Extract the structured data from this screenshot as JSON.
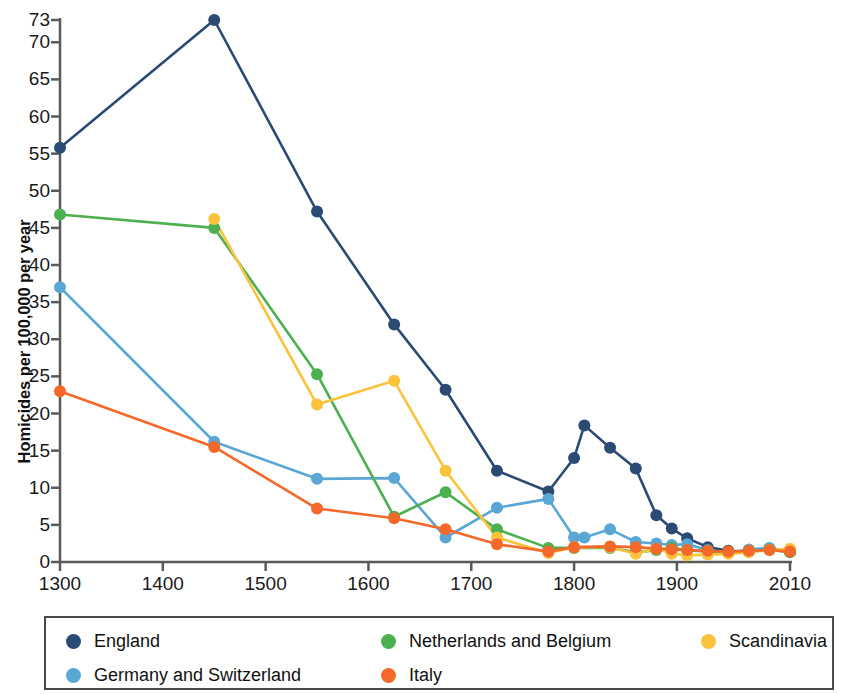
{
  "chart_data": {
    "type": "line",
    "title": "",
    "xlabel": "",
    "ylabel": "Homicides per 100,000 per year",
    "xlim": [
      1300,
      2010
    ],
    "ylim": [
      0,
      73
    ],
    "grid": false,
    "legend_position": "bottom",
    "x_ticks": [
      1300,
      1400,
      1500,
      1600,
      1700,
      1800,
      1900,
      2010
    ],
    "x_tick_labels": [
      "1300",
      "1400",
      "1500",
      "1600",
      "1700",
      "1800",
      "1900",
      "2010"
    ],
    "y_ticks": [
      0,
      5,
      10,
      15,
      20,
      25,
      30,
      35,
      40,
      45,
      50,
      55,
      60,
      65,
      70,
      73
    ],
    "y_tick_labels": [
      "0",
      "5",
      "10",
      "15",
      "20",
      "25",
      "30",
      "35",
      "40",
      "45",
      "50",
      "55",
      "60",
      "65",
      "70",
      "73"
    ],
    "series": [
      {
        "name": "England",
        "color": "#2b4a74",
        "x": [
          1300,
          1450,
          1550,
          1625,
          1675,
          1725,
          1775,
          1800,
          1810,
          1835,
          1860,
          1880,
          1895,
          1910,
          1930,
          1950,
          1970,
          1990,
          2010
        ],
        "values": [
          55.8,
          73.0,
          47.2,
          32.0,
          23.2,
          12.3,
          9.5,
          14.0,
          18.4,
          15.4,
          12.6,
          6.3,
          4.5,
          3.2,
          2.0,
          1.5,
          1.4,
          1.8,
          1.4
        ]
      },
      {
        "name": "Germany and Switzerland",
        "color": "#5aa7d6",
        "x": [
          1300,
          1450,
          1550,
          1625,
          1675,
          1725,
          1775,
          1800,
          1810,
          1835,
          1860,
          1880,
          1895,
          1910,
          1930,
          1950,
          1970,
          1990,
          2010
        ],
        "values": [
          37.0,
          16.2,
          11.2,
          11.3,
          3.3,
          7.3,
          8.5,
          3.3,
          3.3,
          4.4,
          2.7,
          2.5,
          2.3,
          2.4,
          1.6,
          1.2,
          1.7,
          1.9,
          1.4
        ]
      },
      {
        "name": "Netherlands and Belgium",
        "color": "#4caf50",
        "x": [
          1300,
          1450,
          1550,
          1625,
          1675,
          1725,
          1775,
          1800,
          1835,
          1860,
          1880,
          1895,
          1910,
          1930,
          1950,
          1970,
          1990,
          2010
        ],
        "values": [
          46.8,
          45.0,
          25.3,
          6.1,
          9.4,
          4.4,
          1.9,
          1.9,
          1.9,
          1.3,
          1.6,
          1.9,
          1.6,
          1.4,
          1.3,
          1.5,
          1.7,
          1.3
        ]
      },
      {
        "name": "Scandinavia",
        "color": "#fbc23b",
        "x": [
          1450,
          1550,
          1625,
          1675,
          1725,
          1775,
          1800,
          1835,
          1860,
          1880,
          1895,
          1910,
          1930,
          1950,
          1970,
          1990,
          2010
        ],
        "values": [
          46.2,
          21.2,
          24.4,
          12.3,
          3.3,
          1.2,
          2.0,
          2.0,
          1.1,
          1.8,
          1.1,
          0.9,
          1.0,
          1.1,
          1.3,
          1.6,
          1.8
        ]
      },
      {
        "name": "Italy",
        "color": "#f4682a",
        "x": [
          1300,
          1450,
          1550,
          1625,
          1675,
          1725,
          1775,
          1800,
          1835,
          1860,
          1880,
          1895,
          1910,
          1930,
          1950,
          1970,
          1990,
          2010
        ],
        "values": [
          23.0,
          15.5,
          7.2,
          5.9,
          4.4,
          2.4,
          1.4,
          2.0,
          2.1,
          2.0,
          1.8,
          1.7,
          1.6,
          1.5,
          1.4,
          1.5,
          1.6,
          1.4
        ]
      }
    ]
  },
  "axes": {
    "y_title": "Homicides per 100,000 per year"
  },
  "legend": {
    "items": [
      {
        "label": "England",
        "color": "#2b4a74"
      },
      {
        "label": "Netherlands and Belgium",
        "color": "#4caf50"
      },
      {
        "label": "Scandinavia",
        "color": "#fbc23b"
      },
      {
        "label": "Germany and Switzerland",
        "color": "#5aa7d6"
      },
      {
        "label": "Italy",
        "color": "#f4682a"
      }
    ]
  }
}
